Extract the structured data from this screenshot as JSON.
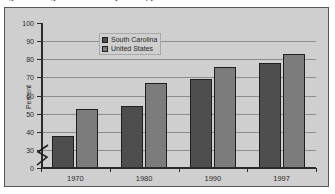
{
  "caption": {
    "remnant_text": "Figure 5.  High school completion, percent"
  },
  "chart_data": {
    "type": "bar",
    "title": "",
    "xlabel": "",
    "ylabel": "Percent",
    "categories": [
      "1970",
      "1980",
      "1990",
      "1997"
    ],
    "series": [
      {
        "name": "South Carolina",
        "color": "#4e4e4e",
        "values": [
          38,
          54,
          69,
          78
        ]
      },
      {
        "name": "United States",
        "color": "#7c7c7c",
        "values": [
          52.5,
          67,
          76,
          83
        ]
      }
    ],
    "ylim": [
      0,
      100
    ],
    "yticks": [
      0,
      30,
      40,
      50,
      60,
      70,
      80,
      90,
      100
    ],
    "ytick_labels": [
      "0",
      "30",
      "40",
      "50",
      "60",
      "70",
      "80",
      "90",
      "100"
    ],
    "axis_break": true,
    "axis_break_between": [
      0,
      30
    ],
    "grid": true,
    "grid_axis": "y",
    "legend_position": "top-left",
    "plot_background": "#cfcfcf",
    "gridline_color": "#8d8d8d",
    "axis_color": "#2b2b2b"
  }
}
